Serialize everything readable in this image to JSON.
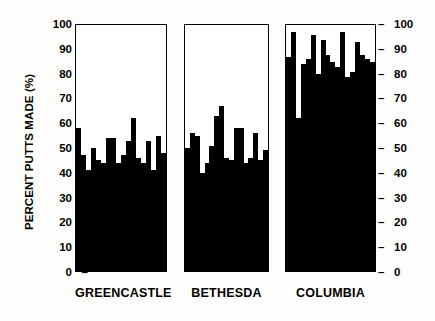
{
  "chart_data": {
    "type": "bar",
    "title": "",
    "xlabel": "",
    "ylabel": "PERCENT PUTTS MADE (%)",
    "ylim": [
      0,
      100
    ],
    "yticks": [
      0,
      10,
      20,
      30,
      40,
      50,
      60,
      70,
      80,
      90,
      100
    ],
    "ytick_labels": [
      "0",
      "10",
      "20",
      "30",
      "40",
      "50",
      "60",
      "70",
      "80",
      "90",
      "100"
    ],
    "grid": false,
    "legend": null,
    "axis_right_mirrored": true,
    "bar_color": "#000000",
    "panel_border_color": "#000000",
    "background": "#ffffff",
    "panels": [
      {
        "label": "GREENCASTLE",
        "categories": [
          "1",
          "2",
          "3",
          "4",
          "5",
          "6",
          "7",
          "8",
          "9",
          "10",
          "11",
          "12",
          "13",
          "14",
          "15",
          "16",
          "17",
          "18"
        ],
        "values": [
          58,
          47,
          41,
          50,
          45,
          44,
          54,
          54,
          44,
          47,
          53,
          62,
          46,
          44,
          53,
          41,
          55,
          48
        ]
      },
      {
        "label": "BETHESDA",
        "categories": [
          "1",
          "2",
          "3",
          "4",
          "5",
          "6",
          "7",
          "8",
          "9",
          "10",
          "11",
          "12",
          "13",
          "14",
          "15",
          "16",
          "17"
        ],
        "values": [
          50,
          56,
          55,
          40,
          44,
          51,
          63,
          67,
          46,
          45,
          58,
          58,
          44,
          46,
          56,
          45,
          49
        ]
      },
      {
        "label": "COLUMBIA",
        "categories": [
          "1",
          "2",
          "3",
          "4",
          "5",
          "6",
          "7",
          "8",
          "9",
          "10",
          "11",
          "12",
          "13",
          "14",
          "15",
          "16",
          "17",
          "18"
        ],
        "values": [
          87,
          97,
          62,
          84,
          86,
          96,
          80,
          94,
          88,
          85,
          83,
          97,
          79,
          81,
          93,
          88,
          86,
          85
        ]
      }
    ]
  },
  "layout": {
    "plot_top_px": 24,
    "plot_bottom_px": 272,
    "panel_boxes": [
      {
        "left": 75,
        "width": 92
      },
      {
        "left": 184,
        "width": 85
      },
      {
        "left": 285,
        "width": 91
      }
    ],
    "caption_top_px": 286
  }
}
